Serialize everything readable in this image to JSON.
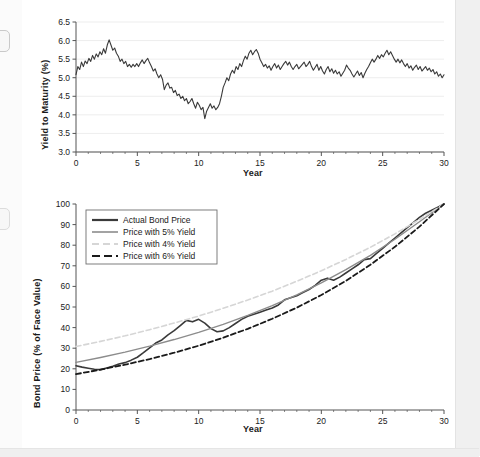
{
  "page": {
    "background_color": "#fbfbfb",
    "panel_color": "#ffffff",
    "edge_color": "#f0f0f0"
  },
  "colors": {
    "actual": "#3a3a3a",
    "yield5": "#8c8c8c",
    "yield4": "#d6d6d6",
    "yield6": "#1a1a1a",
    "grid": "#e8e8e8",
    "axis": "#555555",
    "text": "#1a1a1a"
  },
  "chart_data": [
    {
      "type": "line",
      "id": "yield-to-maturity",
      "title": "",
      "xlabel": "Year",
      "ylabel": "Yield to Maturity (%)",
      "xlim": [
        0,
        30
      ],
      "ylim": [
        3.0,
        6.5
      ],
      "xticks": [
        0,
        5,
        10,
        15,
        20,
        25,
        30
      ],
      "yticks": [
        3.0,
        3.5,
        4.0,
        4.5,
        5.0,
        5.5,
        6.0,
        6.5
      ],
      "ytick_labels": [
        "3.0",
        "3.5",
        "4.0",
        "4.5",
        "5.0",
        "5.5",
        "6.0",
        "6.5"
      ],
      "xtick_labels": [
        "0",
        "5",
        "10",
        "15",
        "20",
        "25",
        "30"
      ],
      "grid": "horizontal",
      "legend": "none",
      "series": [
        {
          "name": "Yield to Maturity",
          "color": "#3a3a3a",
          "style": "solid",
          "x": [
            0,
            0.15,
            0.3,
            0.45,
            0.6,
            0.75,
            0.9,
            1.05,
            1.2,
            1.35,
            1.5,
            1.65,
            1.8,
            1.95,
            2.1,
            2.25,
            2.4,
            2.55,
            2.7,
            2.85,
            3,
            3.15,
            3.3,
            3.45,
            3.6,
            3.75,
            3.9,
            4.05,
            4.2,
            4.35,
            4.5,
            4.65,
            4.8,
            4.95,
            5.1,
            5.25,
            5.4,
            5.55,
            5.7,
            5.85,
            6,
            6.15,
            6.3,
            6.45,
            6.6,
            6.75,
            6.9,
            7.05,
            7.2,
            7.35,
            7.5,
            7.65,
            7.8,
            7.95,
            8.1,
            8.25,
            8.4,
            8.55,
            8.7,
            8.85,
            9,
            9.15,
            9.3,
            9.45,
            9.6,
            9.75,
            9.9,
            10.05,
            10.2,
            10.35,
            10.5,
            10.65,
            10.8,
            10.95,
            11.1,
            11.25,
            11.4,
            11.55,
            11.7,
            11.85,
            12,
            12.15,
            12.3,
            12.45,
            12.6,
            12.75,
            12.9,
            13.05,
            13.2,
            13.35,
            13.5,
            13.65,
            13.8,
            13.95,
            14.1,
            14.25,
            14.4,
            14.55,
            14.7,
            14.85,
            15,
            15.15,
            15.3,
            15.45,
            15.6,
            15.75,
            15.9,
            16.05,
            16.2,
            16.35,
            16.5,
            16.65,
            16.8,
            16.95,
            17.1,
            17.25,
            17.4,
            17.55,
            17.7,
            17.85,
            18,
            18.15,
            18.3,
            18.45,
            18.6,
            18.75,
            18.9,
            19.05,
            19.2,
            19.35,
            19.5,
            19.65,
            19.8,
            19.95,
            20.1,
            20.25,
            20.4,
            20.55,
            20.7,
            20.85,
            21,
            21.15,
            21.3,
            21.45,
            21.6,
            21.75,
            21.9,
            22.05,
            22.2,
            22.35,
            22.5,
            22.65,
            22.8,
            22.95,
            23.1,
            23.25,
            23.4,
            23.55,
            23.7,
            23.85,
            24,
            24.15,
            24.3,
            24.45,
            24.6,
            24.75,
            24.9,
            25.05,
            25.2,
            25.35,
            25.5,
            25.65,
            25.8,
            25.95,
            26.1,
            26.25,
            26.4,
            26.55,
            26.7,
            26.85,
            27,
            27.15,
            27.3,
            27.45,
            27.6,
            27.75,
            27.9,
            28.05,
            28.2,
            28.35,
            28.5,
            28.65,
            28.8,
            28.95,
            29.1,
            29.25,
            29.4,
            29.55,
            29.7,
            29.85,
            30
          ],
          "y": [
            5.08,
            5.3,
            5.22,
            5.42,
            5.3,
            5.45,
            5.38,
            5.52,
            5.44,
            5.6,
            5.5,
            5.64,
            5.56,
            5.7,
            5.62,
            5.78,
            5.66,
            5.88,
            6.02,
            5.88,
            5.74,
            5.8,
            5.66,
            5.58,
            5.44,
            5.5,
            5.38,
            5.44,
            5.3,
            5.36,
            5.28,
            5.36,
            5.3,
            5.38,
            5.3,
            5.4,
            5.48,
            5.38,
            5.46,
            5.52,
            5.4,
            5.3,
            5.18,
            5.24,
            5.1,
            5.0,
            5.08,
            4.96,
            4.68,
            4.8,
            4.86,
            4.72,
            4.74,
            4.6,
            4.66,
            4.52,
            4.56,
            4.44,
            4.5,
            4.38,
            4.44,
            4.3,
            4.36,
            4.44,
            4.3,
            4.18,
            4.34,
            4.26,
            4.14,
            4.2,
            3.9,
            4.1,
            4.2,
            4.3,
            4.18,
            4.24,
            4.14,
            4.2,
            4.3,
            4.5,
            4.74,
            4.86,
            5.0,
            4.92,
            5.1,
            5.2,
            5.12,
            5.3,
            5.22,
            5.38,
            5.3,
            5.46,
            5.58,
            5.5,
            5.66,
            5.74,
            5.62,
            5.7,
            5.76,
            5.66,
            5.5,
            5.4,
            5.3,
            5.36,
            5.26,
            5.32,
            5.2,
            5.3,
            5.38,
            5.26,
            5.34,
            5.22,
            5.3,
            5.38,
            5.44,
            5.34,
            5.42,
            5.3,
            5.22,
            5.3,
            5.36,
            5.24,
            5.3,
            5.36,
            5.42,
            5.3,
            5.36,
            5.44,
            5.3,
            5.2,
            5.28,
            5.36,
            5.2,
            5.3,
            5.18,
            5.1,
            5.22,
            5.3,
            5.16,
            5.24,
            5.12,
            5.2,
            5.1,
            5.16,
            5.04,
            5.12,
            5.2,
            5.34,
            5.26,
            5.2,
            5.1,
            5.02,
            5.1,
            5.18,
            5.06,
            5.14,
            5.0,
            5.12,
            5.22,
            5.3,
            5.4,
            5.5,
            5.42,
            5.5,
            5.6,
            5.52,
            5.62,
            5.56,
            5.66,
            5.74,
            5.62,
            5.7,
            5.6,
            5.5,
            5.42,
            5.5,
            5.4,
            5.48,
            5.38,
            5.3,
            5.38,
            5.26,
            5.32,
            5.2,
            5.28,
            5.34,
            5.22,
            5.3,
            5.18,
            5.24,
            5.3,
            5.2,
            5.26,
            5.16,
            5.22,
            5.1,
            5.16,
            5.04,
            5.1,
            5.0,
            5.08,
            4.96,
            5.02,
            4.9,
            4.96,
            4.86,
            4.72
          ]
        }
      ]
    },
    {
      "type": "line",
      "id": "bond-price",
      "title": "",
      "xlabel": "Year",
      "ylabel": "Bond Price (% of Face Value)",
      "xlim": [
        0,
        30
      ],
      "ylim": [
        0,
        100
      ],
      "xticks": [
        0,
        5,
        10,
        15,
        20,
        25,
        30
      ],
      "yticks": [
        0,
        10,
        20,
        30,
        40,
        50,
        60,
        70,
        80,
        90,
        100
      ],
      "ytick_labels": [
        "0",
        "10",
        "20",
        "30",
        "40",
        "50",
        "60",
        "70",
        "80",
        "90",
        "100"
      ],
      "xtick_labels": [
        "0",
        "5",
        "10",
        "15",
        "20",
        "25",
        "30"
      ],
      "grid": "none",
      "legend": "upper-left",
      "series": [
        {
          "name": "Actual Bond Price",
          "color": "#3a3a3a",
          "style": "solid",
          "width": 1.6,
          "x": [
            0,
            0.5,
            1,
            1.5,
            2,
            2.5,
            3,
            3.5,
            4,
            4.5,
            5,
            5.5,
            6,
            6.5,
            7,
            7.5,
            8,
            8.5,
            9,
            9.5,
            10,
            10.5,
            11,
            11.5,
            12,
            12.5,
            13,
            13.5,
            14,
            14.5,
            15,
            15.5,
            16,
            16.5,
            17,
            17.5,
            18,
            18.5,
            19,
            19.5,
            20,
            20.5,
            21,
            21.5,
            22,
            22.5,
            23,
            23.5,
            24,
            24.5,
            25,
            25.5,
            26,
            26.5,
            27,
            27.5,
            28,
            28.5,
            29,
            29.5,
            30
          ],
          "y": [
            21.5,
            20.8,
            20.3,
            19.8,
            19.6,
            20.4,
            21.2,
            22.3,
            23.0,
            24.2,
            25.6,
            27.8,
            30.2,
            32.5,
            34.0,
            36.5,
            38.5,
            41.0,
            43.5,
            42.8,
            44.0,
            42.2,
            39.5,
            38.0,
            38.4,
            40.0,
            42.0,
            44.0,
            45.5,
            46.5,
            47.5,
            48.5,
            49.5,
            51.0,
            53.5,
            54.5,
            55.5,
            57.0,
            58.5,
            60.5,
            63.0,
            64.0,
            63.0,
            64.5,
            66.5,
            68.5,
            70.5,
            73.0,
            73.5,
            76.0,
            78.5,
            81.0,
            83.5,
            86.0,
            88.5,
            91.0,
            93.5,
            95.5,
            97.0,
            98.5,
            100
          ]
        },
        {
          "name": "Price with 5% Yield",
          "color": "#8c8c8c",
          "style": "solid",
          "width": 1.4,
          "x": [
            0,
            2,
            4,
            6,
            8,
            10,
            12,
            14,
            16,
            18,
            20,
            22,
            24,
            26,
            28,
            30
          ],
          "y": [
            23.1,
            25.5,
            28.1,
            31.0,
            34.2,
            37.7,
            41.6,
            45.9,
            50.7,
            55.9,
            61.7,
            68.1,
            75.1,
            82.9,
            91.4,
            100
          ]
        },
        {
          "name": "Price with 4% Yield",
          "color": "#d6d6d6",
          "style": "dashed",
          "width": 1.6,
          "x": [
            0,
            2,
            4,
            6,
            8,
            10,
            12,
            14,
            16,
            18,
            20,
            22,
            24,
            26,
            28,
            30
          ],
          "y": [
            30.8,
            33.3,
            36.0,
            39.0,
            42.2,
            45.6,
            49.4,
            53.4,
            57.7,
            62.5,
            67.6,
            73.1,
            79.0,
            85.5,
            92.5,
            100
          ]
        },
        {
          "name": "Price with 6% Yield",
          "color": "#1a1a1a",
          "style": "dashed",
          "width": 1.8,
          "x": [
            0,
            2,
            4,
            6,
            8,
            10,
            12,
            14,
            16,
            18,
            20,
            22,
            24,
            26,
            28,
            30
          ],
          "y": [
            17.4,
            19.6,
            22.0,
            24.7,
            27.8,
            31.2,
            35.1,
            39.4,
            44.3,
            49.7,
            55.8,
            62.7,
            70.5,
            79.2,
            89.0,
            100
          ]
        }
      ],
      "legend_entries": [
        {
          "label": "Actual Bond Price",
          "color": "#3a3a3a",
          "style": "solid",
          "width": 2.2
        },
        {
          "label": "Price with 5% Yield",
          "color": "#8c8c8c",
          "style": "solid",
          "width": 1.6
        },
        {
          "label": "Price with 4% Yield",
          "color": "#d6d6d6",
          "style": "dashed",
          "width": 2.0
        },
        {
          "label": "Price with 6% Yield",
          "color": "#1a1a1a",
          "style": "dashed",
          "width": 2.2
        }
      ]
    }
  ]
}
